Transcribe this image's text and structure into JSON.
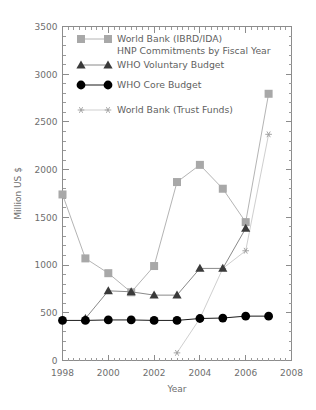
{
  "chart_data": {
    "type": "line",
    "title": "",
    "xlabel": "Year",
    "ylabel": "Million US $",
    "xlim": [
      1998,
      2008
    ],
    "ylim": [
      0,
      3500
    ],
    "xticks": [
      1998,
      2000,
      2002,
      2004,
      2006,
      2008
    ],
    "xtick_labels": [
      "1998",
      "2000",
      "2002",
      "2004",
      "2006",
      "2008"
    ],
    "yticks": [
      0,
      500,
      1000,
      1500,
      2000,
      2500,
      3000,
      3500
    ],
    "ytick_labels": [
      "0",
      "500",
      "1000",
      "1500",
      "2000",
      "2500",
      "3000",
      "3500"
    ],
    "grid": false,
    "legend_position": "upper-left-inside",
    "x": [
      1998,
      1999,
      2000,
      2001,
      2002,
      2003,
      2004,
      2005,
      2006,
      2007
    ],
    "series": [
      {
        "name": "World Bank (IBRD/IDA) HNP Commitments by Fiscal Year",
        "legend_line1": "World Bank (IBRD/IDA)",
        "legend_line2": "HNP Commitments by Fiscal Year",
        "marker": "square",
        "color": "#a8a8a8",
        "line_color": "#b4b4b4",
        "values": [
          1740,
          1070,
          915,
          715,
          990,
          1870,
          2050,
          1800,
          1450,
          2795
        ]
      },
      {
        "name": "WHO Voluntary Budget",
        "legend_line1": "WHO Voluntary Budget",
        "legend_line2": "",
        "marker": "triangle",
        "color": "#3a3a3a",
        "line_color": "#8a8a8a",
        "values": [
          null,
          440,
          730,
          720,
          685,
          685,
          965,
          965,
          1385,
          null
        ]
      },
      {
        "name": "WHO Core Budget",
        "legend_line1": "WHO Core Budget",
        "legend_line2": "",
        "marker": "circle",
        "color": "#000000",
        "line_color": "#1a1a1a",
        "values": [
          420,
          420,
          425,
          425,
          420,
          420,
          440,
          445,
          465,
          465
        ]
      },
      {
        "name": "World Bank (Trust Funds)",
        "legend_line1": "World Bank (Trust Funds)",
        "legend_line2": "",
        "marker": "star",
        "color": "#9b9b9b",
        "line_color": "#cfcfcf",
        "values": [
          null,
          null,
          null,
          null,
          null,
          80,
          440,
          965,
          1150,
          2370
        ]
      }
    ]
  },
  "axes": {
    "ylabel": "Million US $",
    "xlabel": "Year"
  },
  "legend": {
    "entries": [
      {
        "label_line1": "World Bank (IBRD/IDA)",
        "label_line2": "HNP Commitments by Fiscal Year",
        "marker": "square"
      },
      {
        "label_line1": "WHO Voluntary Budget",
        "label_line2": "",
        "marker": "triangle"
      },
      {
        "label_line1": "WHO Core Budget",
        "label_line2": "",
        "marker": "circle"
      },
      {
        "label_line1": "World Bank (Trust Funds)",
        "label_line2": "",
        "marker": "star"
      }
    ]
  }
}
